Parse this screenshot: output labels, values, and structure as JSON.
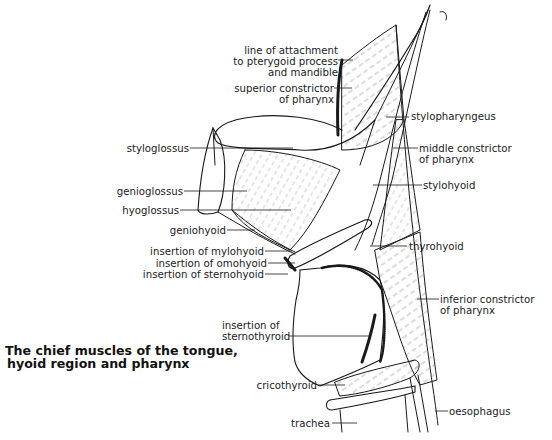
{
  "title": {
    "line1": "The chief muscles of the tongue,",
    "line2": "hyoid region and pharynx"
  },
  "labels": {
    "line_of_attachment": [
      "line of attachment",
      "to pterygoid process",
      "and mandible"
    ],
    "superior_constrictor": [
      "superior constrictor",
      "of pharynx"
    ],
    "stylopharyngeus": "stylopharyngeus",
    "middle_constrictor": [
      "middle constrictor",
      "of pharynx"
    ],
    "styloglossus": "styloglossus",
    "stylohyoid": "stylohyoid",
    "genioglossus": "genioglossus",
    "hyoglossus": "hyoglossus",
    "geniohyoid": "geniohyoid",
    "thyrohyoid": "thyrohyoid",
    "insertion_mylohyoid": "insertion of mylohyoid",
    "insertion_omohyoid": "insertion of omohyoid",
    "insertion_sternohyoid": "insertion of sternohyoid",
    "inferior_constrictor": [
      "inferior constrictor",
      "of pharynx"
    ],
    "insertion_sternothyroid": [
      "insertion of",
      "sternothyroid"
    ],
    "cricothyroid": "cricothyroid",
    "oesophagus": "oesophagus",
    "trachea": "trachea"
  },
  "colors": {
    "ink": "#1a1a1a",
    "background": "#ffffff"
  }
}
